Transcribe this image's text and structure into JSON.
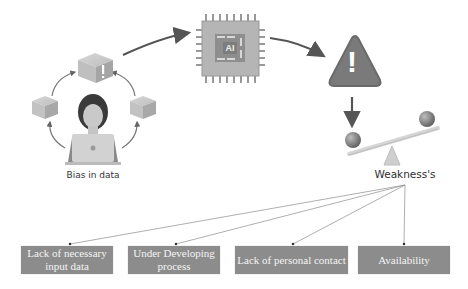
{
  "diagram": {
    "source_label": "Bias in data",
    "chip_label": "AI",
    "warning_symbol": "!",
    "balance_label": "Weakness's",
    "weaknesses": [
      {
        "label": "Lack of necessary input data"
      },
      {
        "label": "Under Developing process"
      },
      {
        "label": "Lack of personal contact"
      },
      {
        "label": "Availability"
      }
    ]
  },
  "colors": {
    "box_fill": "#8c8c8c",
    "box_text": "#f4f4f4",
    "arrow": "#555555",
    "warning_fill": "#7a7a7a",
    "line": "#999999"
  },
  "icons": [
    "cube-icon",
    "person-laptop-icon",
    "ai-chip-icon",
    "warning-triangle-icon",
    "balance-scale-icon"
  ]
}
